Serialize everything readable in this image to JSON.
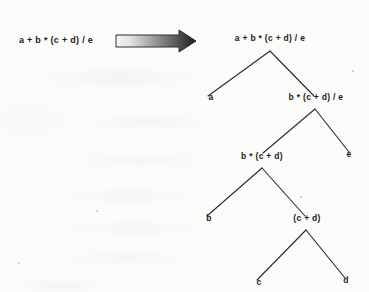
{
  "diagram": {
    "source_expression": "a + b * (c + d) / e",
    "arrow": {
      "name": "transformation-arrow",
      "direction": "right",
      "gradient_from": "#f2f2f0",
      "gradient_to": "#1f1f1f"
    },
    "line_color": "#2a2a2a",
    "text_color": "#1b1b1b",
    "background_color": "#fbfbf9",
    "nodes": [
      {
        "id": "root",
        "label": "a + b * (c + d) / e",
        "x": 270,
        "y": 43,
        "level": 0
      },
      {
        "id": "n-a",
        "label": "a",
        "x": 211,
        "y": 102,
        "level": 1
      },
      {
        "id": "n-bcde",
        "label": "b * (c + d) / e",
        "x": 316,
        "y": 102,
        "level": 1
      },
      {
        "id": "n-bcd",
        "label": "b * (c + d)",
        "x": 262,
        "y": 161,
        "level": 2
      },
      {
        "id": "n-e",
        "label": "e",
        "x": 349,
        "y": 159,
        "level": 2
      },
      {
        "id": "n-b",
        "label": "b",
        "x": 209,
        "y": 223,
        "level": 3
      },
      {
        "id": "n-cd",
        "label": "(c + d)",
        "x": 307,
        "y": 223,
        "level": 3
      },
      {
        "id": "n-c",
        "label": "c",
        "x": 259,
        "y": 287,
        "level": 4
      },
      {
        "id": "n-d",
        "label": "d",
        "x": 346,
        "y": 285,
        "level": 4
      }
    ],
    "edges": [
      {
        "from": "root",
        "to": "n-a",
        "x1": 270,
        "y1": 51,
        "x2": 208,
        "y2": 96
      },
      {
        "from": "root",
        "to": "n-bcde",
        "x1": 270,
        "y1": 51,
        "x2": 314,
        "y2": 96
      },
      {
        "from": "n-bcde",
        "to": "n-bcd",
        "x1": 315,
        "y1": 109,
        "x2": 263,
        "y2": 153
      },
      {
        "from": "n-bcde",
        "to": "n-e",
        "x1": 315,
        "y1": 109,
        "x2": 349,
        "y2": 152
      },
      {
        "from": "n-bcd",
        "to": "n-b",
        "x1": 262,
        "y1": 168,
        "x2": 207,
        "y2": 216
      },
      {
        "from": "n-bcd",
        "to": "n-cd",
        "x1": 262,
        "y1": 168,
        "x2": 305,
        "y2": 216
      },
      {
        "from": "n-cd",
        "to": "n-c",
        "x1": 306,
        "y1": 230,
        "x2": 257,
        "y2": 280
      },
      {
        "from": "n-cd",
        "to": "n-d",
        "x1": 306,
        "y1": 230,
        "x2": 345,
        "y2": 278
      }
    ]
  }
}
